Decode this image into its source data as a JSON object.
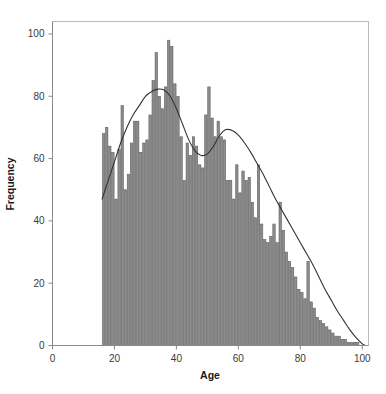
{
  "chart_data": {
    "type": "bar",
    "title": "",
    "subtitle": "",
    "xlabel": "Age",
    "ylabel": "Frequency",
    "xlim": [
      0,
      102
    ],
    "ylim": [
      0,
      104
    ],
    "xticks": [
      0,
      20,
      40,
      60,
      80,
      100
    ],
    "yticks": [
      0,
      20,
      40,
      60,
      80,
      100
    ],
    "grid": false,
    "legend": null,
    "bar_color": "#8c8c8c",
    "bar_edge_color": "#5a5a5a",
    "curve_color": "#333333",
    "frame_color": "#b9b9b9",
    "bin_width": 1,
    "categories": [
      16,
      17,
      18,
      19,
      20,
      21,
      22,
      23,
      24,
      25,
      26,
      27,
      28,
      29,
      30,
      31,
      32,
      33,
      34,
      35,
      36,
      37,
      38,
      39,
      40,
      41,
      42,
      43,
      44,
      45,
      46,
      47,
      48,
      49,
      50,
      51,
      52,
      53,
      54,
      55,
      56,
      57,
      58,
      59,
      60,
      61,
      62,
      63,
      64,
      65,
      66,
      67,
      68,
      69,
      70,
      71,
      72,
      73,
      74,
      75,
      76,
      77,
      78,
      79,
      80,
      81,
      82,
      83,
      84,
      85,
      86,
      87,
      88,
      89,
      90,
      91,
      92,
      93,
      94,
      95,
      96,
      97,
      98,
      99,
      100
    ],
    "values": [
      68,
      70,
      64,
      62,
      47,
      63,
      77,
      50,
      55,
      65,
      72,
      72,
      62,
      65,
      66,
      74,
      85,
      94,
      80,
      76,
      83,
      98,
      96,
      84,
      80,
      67,
      53,
      65,
      61,
      67,
      64,
      58,
      57,
      74,
      83,
      73,
      67,
      72,
      67,
      66,
      53,
      53,
      47,
      58,
      49,
      56,
      53,
      54,
      46,
      41,
      58,
      39,
      34,
      33,
      35,
      39,
      33,
      46,
      37,
      30,
      27,
      25,
      22,
      18,
      17,
      15,
      27,
      14,
      12,
      9,
      8,
      7,
      6,
      5,
      4,
      3,
      3,
      2,
      2,
      1,
      1,
      1,
      1,
      0,
      0
    ],
    "density_curve": {
      "label": "kernel density overlay",
      "x": [
        16,
        18,
        20,
        22,
        24,
        26,
        28,
        30,
        32,
        34,
        36,
        38,
        40,
        42,
        44,
        46,
        48,
        50,
        52,
        54,
        56,
        58,
        60,
        62,
        64,
        66,
        68,
        70,
        72,
        74,
        76,
        78,
        80,
        82,
        84,
        86,
        88,
        90,
        92,
        94,
        96,
        98,
        100,
        101
      ],
      "y": [
        47,
        53,
        59,
        65,
        70,
        74,
        77,
        80,
        81.5,
        82.3,
        82,
        80,
        76,
        71,
        66,
        62.5,
        61,
        61.5,
        64,
        67.5,
        69.3,
        69,
        67.5,
        65,
        62,
        58.5,
        55,
        51,
        47,
        43.5,
        40,
        36.5,
        33,
        29.5,
        26,
        22,
        18,
        14.5,
        11,
        8,
        5,
        2.5,
        0.5,
        0
      ]
    }
  },
  "axes": {
    "x_tick_labels": [
      "0",
      "20",
      "40",
      "60",
      "80",
      "100"
    ],
    "y_tick_labels": [
      "0",
      "20",
      "40",
      "60",
      "80",
      "100"
    ],
    "x_axis_title": "Age",
    "y_axis_title": "Frequency"
  }
}
